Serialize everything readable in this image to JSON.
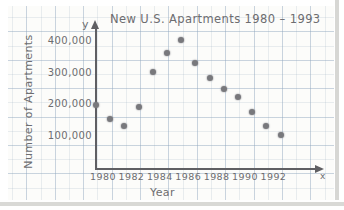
{
  "chart_data": {
    "type": "scatter",
    "title": "New U.S. Apartments 1980 – 1993",
    "xlabel": "Year",
    "ylabel": "Number of Apartments",
    "x_axis_letter": "x",
    "y_axis_letter": "y",
    "xlim": [
      1979.2,
      1994.5
    ],
    "ylim": [
      0,
      430000
    ],
    "grid": true,
    "grid_style": "graph-paper",
    "legend": "none",
    "x_ticks": [
      "1980",
      "1982",
      "1984",
      "1986",
      "1988",
      "1990",
      "1992"
    ],
    "x_tick_values": [
      1980,
      1982,
      1984,
      1986,
      1988,
      1990,
      1992
    ],
    "y_ticks": [
      "100,000",
      "200,000",
      "300,000",
      "400,000"
    ],
    "y_tick_values": [
      100000,
      200000,
      300000,
      400000
    ],
    "x": [
      1980,
      1981,
      1982,
      1983,
      1984,
      1985,
      1986,
      1987,
      1988,
      1989,
      1990,
      1991,
      1992,
      1993
    ],
    "values": [
      200000,
      155000,
      135000,
      195000,
      305000,
      365000,
      405000,
      335000,
      285000,
      250000,
      225000,
      180000,
      135000,
      105000
    ],
    "points": [
      {
        "year": 1980,
        "apartments": 200000
      },
      {
        "year": 1981,
        "apartments": 155000
      },
      {
        "year": 1982,
        "apartments": 135000
      },
      {
        "year": 1983,
        "apartments": 195000
      },
      {
        "year": 1984,
        "apartments": 305000
      },
      {
        "year": 1985,
        "apartments": 365000
      },
      {
        "year": 1986,
        "apartments": 405000
      },
      {
        "year": 1987,
        "apartments": 335000
      },
      {
        "year": 1988,
        "apartments": 285000
      },
      {
        "year": 1989,
        "apartments": 250000
      },
      {
        "year": 1990,
        "apartments": 225000
      },
      {
        "year": 1991,
        "apartments": 180000
      },
      {
        "year": 1992,
        "apartments": 135000
      },
      {
        "year": 1993,
        "apartments": 105000
      }
    ],
    "colors": {
      "ink": "#6f6f72",
      "point": "#78787c",
      "axis": "#5f5f63",
      "grid": "#96aabe",
      "paper": "#fcfcfa"
    }
  }
}
